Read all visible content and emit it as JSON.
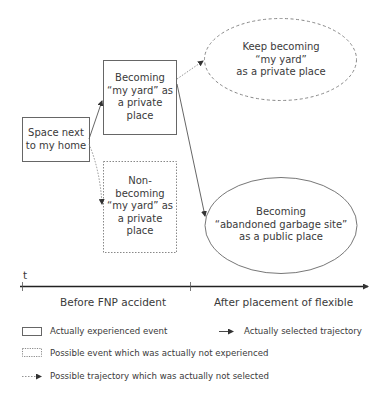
{
  "nodes": {
    "start": {
      "label": "Space next\nto my home",
      "type": "actually-experienced-event"
    },
    "becoming": {
      "label": "Becoming\n“my yard” as\na private\nplace",
      "type": "actually-experienced-event"
    },
    "non_becoming": {
      "label": "Non-\nbecoming\n“my yard” as\na private\nplace",
      "type": "possible-event-not-experienced"
    },
    "keep_becoming": {
      "label": "Keep becoming\n“my yard”\nas a private place",
      "type": "possible-outcome-not-experienced"
    },
    "garbage_site": {
      "label": "Becoming\n“abandoned garbage site”\nas a public place",
      "type": "actually-experienced-outcome"
    }
  },
  "edges": [
    {
      "from": "start",
      "to": "becoming",
      "style": "solid"
    },
    {
      "from": "start",
      "to": "non_becoming",
      "style": "dotted"
    },
    {
      "from": "becoming",
      "to": "keep_becoming",
      "style": "dotted"
    },
    {
      "from": "becoming",
      "to": "garbage_site",
      "style": "solid"
    }
  ],
  "timeline": {
    "axis_label": "t",
    "periods": [
      "Before FNP accident",
      "After placement of flexible"
    ]
  },
  "legend": {
    "solid_box": "Actually experienced event",
    "solid_arrow": "Actually selected trajectory",
    "dotted_box": "Possible event which was actually not experienced",
    "dotted_arrow": "Possible trajectory which was actually not selected"
  },
  "colors": {
    "line": "#555555",
    "text": "#3a3a3a"
  }
}
